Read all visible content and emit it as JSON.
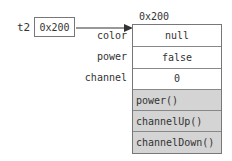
{
  "variable": {
    "name": "t2",
    "value": "0x200"
  },
  "object": {
    "address": "0x200",
    "fields": [
      {
        "name": "color",
        "value": "null"
      },
      {
        "name": "power",
        "value": "false"
      },
      {
        "name": "channel",
        "value": "0"
      }
    ],
    "methods": [
      "power()",
      "channelUp()",
      "channelDown()"
    ]
  },
  "colors": {
    "border": "#777777",
    "method_fill": "#d4d4d4",
    "text": "#333333"
  }
}
